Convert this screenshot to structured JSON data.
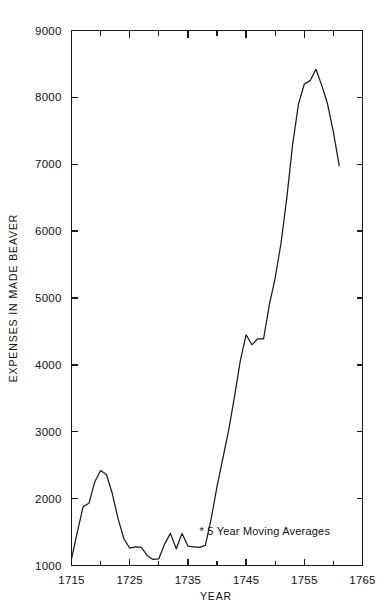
{
  "chart_data": {
    "type": "line",
    "title": "",
    "xlabel": "YEAR",
    "ylabel": "EXPENSES IN MADE BEAVER",
    "xlim": [
      1715,
      1765
    ],
    "ylim": [
      1000,
      9000
    ],
    "grid": false,
    "legend": "none",
    "annotations": [
      {
        "text": "* 5 Year Moving Averages",
        "x": 1737,
        "y": 1450
      }
    ],
    "xticks_major": [
      1715,
      1725,
      1735,
      1745,
      1755,
      1765
    ],
    "xticks_major_labels": [
      "1715",
      "1725",
      "1735",
      "1745",
      "1755",
      "1765"
    ],
    "xticks_minor": [
      1720,
      1730,
      1740,
      1750,
      1760
    ],
    "yticks": [
      1000,
      2000,
      3000,
      4000,
      5000,
      6000,
      7000,
      8000,
      9000
    ],
    "ytick_labels": [
      "1000",
      "2000",
      "3000",
      "4000",
      "5000",
      "6000",
      "7000",
      "8000",
      "9000"
    ],
    "series": [
      {
        "name": "Expenses in Made Beaver (5 Year Moving Average)",
        "color": "#1a1a1a",
        "x": [
          1715,
          1716,
          1717,
          1718,
          1719,
          1720,
          1721,
          1722,
          1723,
          1724,
          1725,
          1726,
          1727,
          1728,
          1729,
          1730,
          1731,
          1732,
          1733,
          1734,
          1735,
          1736,
          1737,
          1738,
          1739,
          1740,
          1741,
          1742,
          1743,
          1744,
          1745,
          1746,
          1747,
          1748,
          1749,
          1750,
          1751,
          1752,
          1753,
          1754,
          1755,
          1756,
          1757,
          1758,
          1759,
          1760,
          1761
        ],
        "y": [
          1100,
          1500,
          1880,
          1930,
          2250,
          2420,
          2360,
          2080,
          1700,
          1400,
          1260,
          1280,
          1270,
          1150,
          1090,
          1100,
          1320,
          1480,
          1250,
          1480,
          1290,
          1280,
          1270,
          1300,
          1700,
          2180,
          2600,
          3020,
          3520,
          4060,
          4450,
          4300,
          4390,
          4390,
          4900,
          5300,
          5820,
          6500,
          7300,
          7900,
          8200,
          8250,
          8420,
          8180,
          7900,
          7480,
          6980
        ]
      }
    ]
  },
  "labels": {
    "xaxis_title": "YEAR",
    "yaxis_title": "EXPENSES IN MADE BEAVER",
    "footnote": "* 5 Year Moving Averages"
  }
}
